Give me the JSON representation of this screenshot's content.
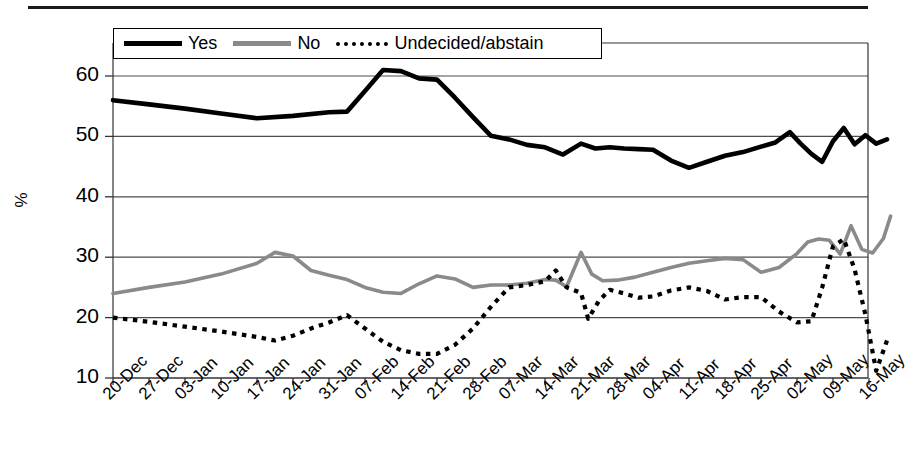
{
  "chart_data": {
    "type": "line",
    "title": "",
    "xlabel": "",
    "ylabel": "%",
    "ylim": [
      10,
      65
    ],
    "yticks": [
      10,
      20,
      30,
      40,
      50,
      60
    ],
    "grid": true,
    "legend_position": "top",
    "categories": [
      "20-Dec",
      "27-Dec",
      "03-Jan",
      "10-Jan",
      "17-Jan",
      "24-Jan",
      "31-Jan",
      "07-Feb",
      "14-Feb",
      "21-Feb",
      "28-Feb",
      "07-Mar",
      "14-Mar",
      "21-Mar",
      "28-Mar",
      "04-Apr",
      "11-Apr",
      "18-Apr",
      "25-Apr",
      "02-May",
      "09-May",
      "16-May"
    ],
    "x_positions": [
      0,
      1,
      2,
      3,
      4,
      5,
      6,
      7,
      8,
      9,
      10,
      11,
      12,
      13,
      14,
      15,
      16,
      17,
      18,
      19,
      20,
      21
    ],
    "series": [
      {
        "name": "Yes",
        "color": "#000000",
        "style": "solid",
        "x": [
          0,
          1,
          2,
          3,
          4,
          5,
          6,
          6.5,
          7,
          7.5,
          8,
          8.5,
          9,
          9.5,
          10,
          10.5,
          11,
          11.5,
          12,
          12.5,
          13,
          13.4,
          13.8,
          14.2,
          14.6,
          15,
          15.5,
          16,
          16.5,
          17,
          17.5,
          18,
          18.4,
          18.8,
          19.1,
          19.4,
          19.7,
          20,
          20.3,
          20.6,
          20.9,
          21.2,
          21.5
        ],
        "values": [
          56,
          55.3,
          54.6,
          53.8,
          53.0,
          53.4,
          54.0,
          54.1,
          57.5,
          61.0,
          60.8,
          59.6,
          59.4,
          56.4,
          53.2,
          50.1,
          49.5,
          48.6,
          48.2,
          47.0,
          48.8,
          48.0,
          48.2,
          48.0,
          47.9,
          47.8,
          46.0,
          44.8,
          45.8,
          46.8,
          47.4,
          48.3,
          49.0,
          50.7,
          48.8,
          47.1,
          45.8,
          49.2,
          51.4,
          48.7,
          50.2,
          48.8,
          49.5
        ]
      },
      {
        "name": "No",
        "color": "#8a8a8a",
        "style": "solid",
        "x": [
          0,
          1,
          2,
          3,
          4,
          4.5,
          5,
          5.5,
          6,
          6.5,
          7,
          7.5,
          8,
          8.5,
          9,
          9.5,
          10,
          10.5,
          11,
          11.5,
          12,
          12.3,
          12.6,
          13,
          13.3,
          13.6,
          14,
          14.5,
          15,
          15.5,
          16,
          16.5,
          17,
          17.5,
          18,
          18.5,
          19,
          19.3,
          19.6,
          19.9,
          20.2,
          20.5,
          20.8,
          21.1,
          21.4,
          21.6
        ],
        "values": [
          24.0,
          25.0,
          25.9,
          27.2,
          29.0,
          30.8,
          30.2,
          27.8,
          27.0,
          26.3,
          25.0,
          24.2,
          24.0,
          25.6,
          26.9,
          26.4,
          25.0,
          25.4,
          25.4,
          25.7,
          26.3,
          26.2,
          25.1,
          30.8,
          27.2,
          26.1,
          26.2,
          26.7,
          27.5,
          28.3,
          29.0,
          29.4,
          29.8,
          29.6,
          27.5,
          28.3,
          30.6,
          32.5,
          33.0,
          32.8,
          30.5,
          35.2,
          31.3,
          30.7,
          33.1,
          36.8
        ]
      },
      {
        "name": "Undecided/abstain",
        "color": "#000000",
        "style": "dotted",
        "x": [
          0,
          1,
          2,
          3,
          4,
          4.5,
          5,
          5.5,
          6,
          6.5,
          7,
          7.5,
          8,
          8.5,
          9,
          9.5,
          10,
          10.5,
          11,
          11.5,
          12,
          12.3,
          12.6,
          13,
          13.2,
          13.5,
          13.8,
          14.2,
          14.6,
          15,
          15.5,
          16,
          16.5,
          17,
          17.5,
          18,
          18.5,
          19,
          19.4,
          19.7,
          20,
          20.3,
          20.6,
          20.9,
          21.2,
          21.5
        ],
        "values": [
          20.0,
          19.3,
          18.5,
          17.7,
          16.8,
          16.2,
          17.0,
          18.2,
          19.2,
          20.4,
          18.2,
          16.0,
          14.6,
          14.0,
          14.0,
          15.5,
          18.2,
          21.8,
          25.0,
          25.4,
          26.0,
          27.8,
          25.0,
          24.1,
          19.8,
          22.8,
          24.6,
          24.0,
          23.3,
          23.5,
          24.5,
          25.0,
          24.4,
          23.0,
          23.4,
          23.4,
          21.0,
          19.2,
          19.4,
          25.0,
          31.8,
          33.0,
          28.0,
          20.5,
          11.2,
          16.2
        ]
      }
    ]
  },
  "legend": {
    "items": [
      {
        "label": "Yes",
        "style": "solid-black"
      },
      {
        "label": "No",
        "style": "solid-gray"
      },
      {
        "label": "Undecided/abstain",
        "style": "dotted"
      }
    ]
  },
  "axis": {
    "y_title": "%",
    "y_tick_labels": [
      "60",
      "50",
      "40",
      "30",
      "20",
      "10"
    ],
    "x_tick_labels": [
      "20-Dec",
      "27-Dec",
      "03-Jan",
      "10-Jan",
      "17-Jan",
      "24-Jan",
      "31-Jan",
      "07-Feb",
      "14-Feb",
      "21-Feb",
      "28-Feb",
      "07-Mar",
      "14-Mar",
      "21-Mar",
      "28-Mar",
      "04-Apr",
      "11-Apr",
      "18-Apr",
      "25-Apr",
      "02-May",
      "09-May",
      "16-May"
    ]
  }
}
